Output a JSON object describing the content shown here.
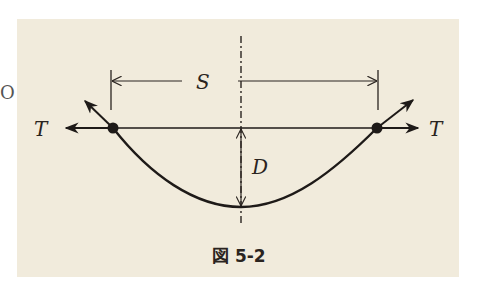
{
  "figure": {
    "caption": "図 5-2",
    "labels": {
      "span": "S",
      "sag": "D",
      "tension_left": "T",
      "tension_right": "T"
    },
    "edge_fragment": "O",
    "colors": {
      "background": "#f1ebdc",
      "ink": "#1e1a18"
    }
  }
}
